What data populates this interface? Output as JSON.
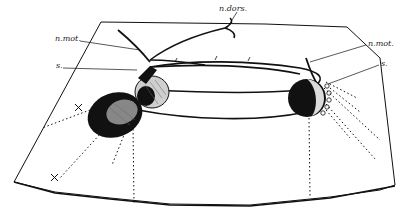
{
  "figure": {
    "type": "anatomical line drawing",
    "ink_color": "#111111",
    "background": "#ffffff",
    "labels": [
      {
        "id": "n-mot-left",
        "text": "n.mot.",
        "x": 55,
        "y": 37
      },
      {
        "id": "s-left",
        "text": "s.",
        "x": 56,
        "y": 64
      },
      {
        "id": "n-dors",
        "text": "n.dors.",
        "x": 219,
        "y": 9
      },
      {
        "id": "n-mot-right",
        "text": "n.mot.",
        "x": 368,
        "y": 41
      },
      {
        "id": "s-right",
        "text": "s.",
        "x": 381,
        "y": 61
      }
    ],
    "markers": [
      {
        "id": "cross-upper",
        "symbol": "×",
        "x": 74,
        "y": 107
      },
      {
        "id": "cross-lower",
        "symbol": "×",
        "x": 51,
        "y": 176
      }
    ]
  }
}
